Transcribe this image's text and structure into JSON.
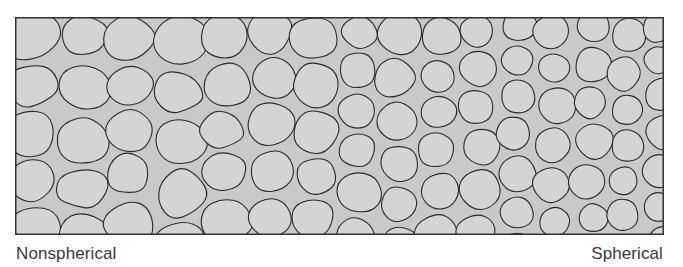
{
  "figure": {
    "frame": {
      "fill_color": "#c9c9c9",
      "grain_color": "#d4d4d4",
      "outline_color": "#2a2a2a"
    },
    "labels": {
      "left": "Nonspherical",
      "right": "Spherical"
    }
  }
}
